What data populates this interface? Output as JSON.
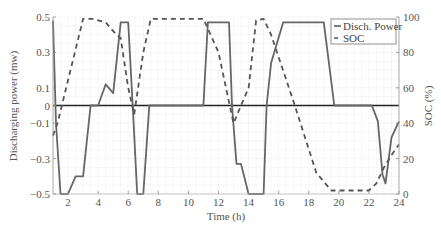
{
  "chart_data": {
    "type": "line",
    "title": "",
    "xlabel": "Time (h)",
    "ylabel": "Discharging power (mw)",
    "y2label": "SOC (%)",
    "xlim": [
      1,
      24
    ],
    "ylim": [
      -0.5,
      0.5
    ],
    "y2lim": [
      0,
      100
    ],
    "grid": true,
    "legend_position": "upper right",
    "x_ticks": [
      2,
      4,
      6,
      8,
      10,
      12,
      14,
      16,
      18,
      20,
      22,
      24
    ],
    "y_ticks": [
      0.5,
      0.3,
      0.1,
      0,
      -0.1,
      -0.3,
      -0.5
    ],
    "y_tick_labels": [
      "0.5",
      "0.3",
      "0.1",
      "0",
      "−0.1",
      "−0.3",
      "−0.5"
    ],
    "y2_ticks": [
      0,
      20,
      40,
      60,
      80,
      100
    ],
    "series": [
      {
        "name": "Disch. Power",
        "axis": "left",
        "style": "solid",
        "color": "#666666",
        "x": [
          1,
          1.2,
          1.5,
          2,
          2.5,
          3,
          3.5,
          4,
          4.5,
          5,
          5.5,
          6,
          6.3,
          6.6,
          7,
          7.4,
          8,
          11,
          11.3,
          12.7,
          12.9,
          13.2,
          13.5,
          14,
          14.5,
          15,
          15.2,
          15.5,
          16.3,
          19,
          19.7,
          21,
          22.2,
          22.6,
          22.9,
          23.1,
          23.5,
          24
        ],
        "values": [
          0.48,
          -0.1,
          -0.5,
          -0.5,
          -0.4,
          -0.4,
          0,
          0,
          0.12,
          0.07,
          0.47,
          0.47,
          0,
          -0.5,
          -0.5,
          0,
          0,
          0,
          0.47,
          0.47,
          0,
          -0.33,
          -0.33,
          -0.5,
          -0.5,
          -0.5,
          0,
          0.24,
          0.47,
          0.47,
          0,
          0,
          0,
          -0.09,
          -0.39,
          -0.44,
          -0.18,
          -0.09
        ]
      },
      {
        "name": "SOC",
        "axis": "right",
        "style": "dashed",
        "color": "#555555",
        "x": [
          1,
          1.3,
          3,
          3.6,
          4.5,
          5,
          5.5,
          6,
          6.4,
          7,
          7.5,
          8.5,
          11,
          12,
          13,
          14,
          14.5,
          15,
          15.5,
          17,
          18.5,
          19.5,
          21,
          22,
          22.5,
          23,
          23.5,
          24
        ],
        "values": [
          33,
          40,
          99,
          99,
          97,
          92,
          88,
          60,
          45,
          80,
          99,
          99,
          99,
          80,
          40,
          60,
          98,
          99,
          90,
          52,
          12,
          2,
          2,
          2,
          6,
          15,
          22,
          28
        ]
      }
    ]
  },
  "legend": {
    "items": [
      "Disch. Power",
      "SOC"
    ]
  },
  "axes": {
    "xlabel": "Time (h)",
    "ylabel": "Discharging power (mw)",
    "y2label": "SOC (%)"
  }
}
